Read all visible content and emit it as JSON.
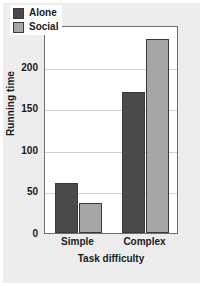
{
  "chart_data": {
    "type": "bar",
    "title": "",
    "xlabel": "Task difficulty",
    "ylabel": "Running time",
    "categories": [
      "Simple",
      "Complex"
    ],
    "series": [
      {
        "name": "Alone",
        "values": [
          60,
          170
        ],
        "color": "#4a4a4a"
      },
      {
        "name": "Social",
        "values": [
          36,
          233
        ],
        "color": "#a6a6a6"
      }
    ],
    "ylim": [
      0,
      250
    ],
    "yticks": [
      0,
      50,
      100,
      150,
      200,
      250
    ],
    "ytick_labels": [
      "0",
      "50",
      "100",
      "150",
      "200",
      "250"
    ],
    "grid": true,
    "grid_axis": "y",
    "legend_position": "upper-left-inside",
    "legend_entries": [
      "Alone",
      "Social"
    ]
  },
  "figure": {
    "background_color": "#ededed",
    "plot_background_color": "#ffffff",
    "axis_color": "#6e6e6e",
    "grid_color": "#d2d2d2",
    "text_color": "#1a1a1a"
  }
}
